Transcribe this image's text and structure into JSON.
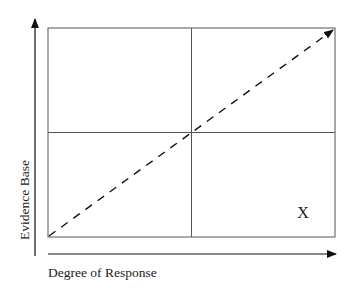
{
  "diagram": {
    "type": "quadrant-matrix",
    "x_axis": {
      "label": "Degree of Response"
    },
    "y_axis": {
      "label": "Evidence Base"
    },
    "marker": {
      "label": "X",
      "quadrant": "bottom-right"
    },
    "diagonal": {
      "style": "dashed-arrow",
      "from": "bottom-left",
      "to": "top-right"
    },
    "colors": {
      "line": "#444444",
      "axis": "#111111",
      "text": "#222222",
      "background": "#ffffff"
    }
  }
}
